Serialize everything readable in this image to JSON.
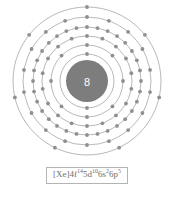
{
  "figure": {
    "name": "bohr-model-diagram",
    "element_symbol": "At",
    "nucleus_label": "8",
    "nucleus_radius": 21,
    "center_x": 86,
    "center_y": 79,
    "ring_color": "#9a9a9a",
    "electron_color": "#8f8f8f",
    "nucleus_color": "#7d7d7d",
    "border_color": "#b4b4b4"
  },
  "shells": [
    {
      "index": 1,
      "label": "K",
      "electrons": 2,
      "radius": 27
    },
    {
      "index": 2,
      "label": "L",
      "electrons": 8,
      "radius": 36
    },
    {
      "index": 3,
      "label": "M",
      "electrons": 18,
      "radius": 45
    },
    {
      "index": 4,
      "label": "N",
      "electrons": 32,
      "radius": 54
    },
    {
      "index": 5,
      "label": "O",
      "electrons": 18,
      "radius": 64
    },
    {
      "index": 6,
      "label": "P",
      "electrons": 7,
      "radius": 74
    }
  ],
  "configuration": {
    "label": "[Xe]4f145d106s26p5",
    "core": "[Xe]",
    "subshells": [
      {
        "orbital": "4f",
        "count": "14"
      },
      {
        "orbital": "5d",
        "count": "10"
      },
      {
        "orbital": "6s",
        "count": "2"
      },
      {
        "orbital": "6p",
        "count": "5"
      }
    ]
  },
  "chart_data": {
    "type": "diagram",
    "categories": [
      "K",
      "L",
      "M",
      "N",
      "O",
      "P"
    ],
    "values": [
      2,
      8,
      18,
      32,
      18,
      7
    ],
    "xlabel": "Shell",
    "ylabel": "Electrons",
    "annotations": [
      "[Xe]4f145d106s26p5"
    ]
  }
}
